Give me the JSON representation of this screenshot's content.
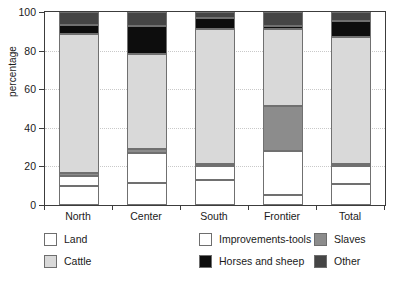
{
  "chart_data": {
    "type": "bar",
    "subtype": "stacked-bar-100",
    "title": "",
    "xlabel": "",
    "ylabel": "percentage",
    "ylim": [
      0,
      100
    ],
    "yticks": [
      0,
      20,
      40,
      60,
      80,
      100
    ],
    "ytick_labels": [
      "0",
      "20",
      "40",
      "60",
      "80",
      "100"
    ],
    "grid": true,
    "grid_axis": "y",
    "legend_position": "bottom",
    "legend_columns": 3,
    "categories": [
      "North",
      "Center",
      "South",
      "Frontier",
      "Total"
    ],
    "series": [
      {
        "name": "Land",
        "color": "#ffffff",
        "values": [
          10.0,
          11.5,
          13.0,
          5.0,
          11.0
        ]
      },
      {
        "name": "Improvements-tools",
        "color": "#ffffff",
        "values": [
          5.0,
          15.5,
          7.0,
          23.0,
          9.0
        ]
      },
      {
        "name": "Slaves",
        "color": "#8c8c8c",
        "values": [
          1.5,
          2.0,
          1.5,
          23.5,
          1.5
        ]
      },
      {
        "name": "Cattle",
        "color": "#d9d9d9",
        "values": [
          72.0,
          49.5,
          69.5,
          39.5,
          65.5
        ]
      },
      {
        "name": "Horses and sheep",
        "color": "#0d0d0d",
        "values": [
          5.0,
          14.5,
          6.0,
          2.0,
          8.5
        ]
      },
      {
        "name": "Other",
        "color": "#454545",
        "values": [
          6.5,
          7.0,
          3.0,
          7.0,
          4.5
        ]
      }
    ],
    "cumulative_tops": {
      "North": [
        10.0,
        15.0,
        16.5,
        88.5,
        93.5,
        100.0
      ],
      "Center": [
        11.5,
        27.0,
        29.0,
        78.5,
        93.0,
        100.0
      ],
      "South": [
        13.0,
        20.0,
        21.5,
        91.0,
        97.0,
        100.0
      ],
      "Frontier": [
        5.0,
        28.0,
        51.5,
        91.0,
        93.0,
        100.0
      ],
      "Total": [
        11.0,
        20.0,
        21.5,
        87.0,
        95.5,
        100.0
      ]
    }
  },
  "legend": {
    "items": [
      {
        "label": "Land",
        "swatch": "legend-swatch-land"
      },
      {
        "label": "Improvements-tools",
        "swatch": "legend-swatch-improvements-tools"
      },
      {
        "label": "Slaves",
        "swatch": "legend-swatch-slaves"
      },
      {
        "label": "Cattle",
        "swatch": "legend-swatch-cattle"
      },
      {
        "label": "Horses and sheep",
        "swatch": "legend-swatch-horses-and-sheep"
      },
      {
        "label": "Other",
        "swatch": "legend-swatch-other"
      }
    ]
  }
}
